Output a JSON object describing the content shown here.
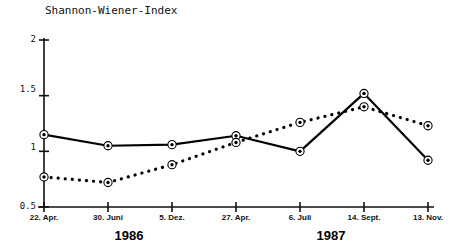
{
  "chart_data": {
    "type": "line",
    "title": "Shannon-Wiener-Index",
    "xlabel": "",
    "ylabel": "Shannon-Wiener-Index",
    "ylim": [
      0.5,
      2
    ],
    "yticks": [
      0.5,
      1,
      1.5,
      2
    ],
    "ytick_labels": [
      "0.5",
      "1",
      "1.5",
      "2"
    ],
    "grid": false,
    "legend_position": "none",
    "categories": [
      "22. Apr.",
      "30. Juni",
      "5. Dez.",
      "27. Apr.",
      "6. Juli",
      "14. Sept.",
      "13. Nov."
    ],
    "group_labels": [
      "1986",
      "1987"
    ],
    "series": [
      {
        "name": "solid-line-series",
        "style": "solid",
        "marker": "circle-dot",
        "values": [
          1.15,
          1.05,
          1.06,
          1.14,
          1.0,
          1.52,
          0.92
        ]
      },
      {
        "name": "dotted-line-series",
        "style": "dotted",
        "marker": "circle-dot",
        "values": [
          0.77,
          0.72,
          0.88,
          1.08,
          1.26,
          1.4,
          1.23
        ]
      }
    ],
    "colors": {
      "axis": "#111111",
      "solid_series": "#000000",
      "dotted_series": "#000000",
      "background": "#ffffff"
    }
  }
}
